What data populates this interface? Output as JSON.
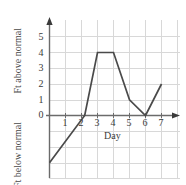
{
  "chart_data": {
    "type": "line",
    "title": "",
    "subtitle": "",
    "xlabel": "Day",
    "ylabel_above": "Ft above normal",
    "ylabel_below": "Ft below normal",
    "x": [
      0,
      2.2,
      3,
      4,
      5,
      6,
      7
    ],
    "values": [
      -3,
      0,
      4,
      4,
      1,
      0,
      2
    ],
    "series": [
      {
        "name": "Water level",
        "points": [
          {
            "x": 0,
            "y": -3
          },
          {
            "x": 2.2,
            "y": 0
          },
          {
            "x": 3,
            "y": 4
          },
          {
            "x": 4,
            "y": 4
          },
          {
            "x": 5,
            "y": 1
          },
          {
            "x": 6,
            "y": 0
          },
          {
            "x": 7,
            "y": 2
          }
        ]
      }
    ],
    "xticks": [
      1,
      2,
      3,
      4,
      5,
      6,
      7
    ],
    "xtick_labels": [
      "1",
      "2",
      "3",
      "4",
      "5",
      "6",
      "7"
    ],
    "yticks": [
      0,
      1,
      2,
      3,
      4,
      5
    ],
    "ytick_labels": [
      "0",
      "1",
      "2",
      "3",
      "4",
      "5"
    ],
    "xlim": [
      0,
      7.6
    ],
    "ylim": [
      -4,
      5.6
    ],
    "grid": true,
    "legend": "none",
    "colors": {
      "line": "#4a4a4a",
      "axis": "#555555",
      "grid": "#d8d8d8",
      "text": "#3a3a3a",
      "background": "#ffffff"
    }
  },
  "axes": {
    "y_axis_arrow": "arrow-up-icon",
    "x_axis_arrow": "arrow-right-icon"
  }
}
